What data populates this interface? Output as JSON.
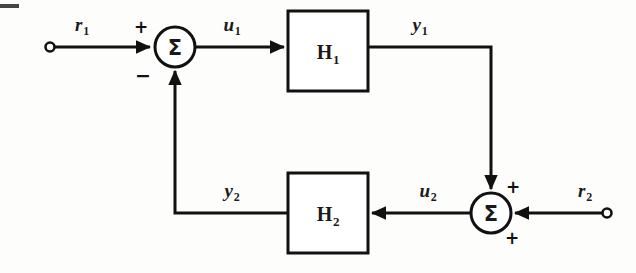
{
  "diagram": {
    "type": "control-block-diagram",
    "background_color": "#fdfdfb",
    "line_color": "#111111",
    "line_width": 3,
    "blocks": [
      {
        "id": "H1",
        "label": "H",
        "subscript": "1",
        "x": 288,
        "y": 11,
        "width": 80,
        "height": 80
      },
      {
        "id": "H2",
        "label": "H",
        "subscript": "2",
        "x": 288,
        "y": 173,
        "width": 80,
        "height": 80
      }
    ],
    "summers": [
      {
        "id": "sum1",
        "glyph": "Σ",
        "cx": 175,
        "cy": 47,
        "r": 20
      },
      {
        "id": "sum2",
        "glyph": "Σ",
        "cx": 491,
        "cy": 213,
        "r": 20
      }
    ],
    "terminals": [
      {
        "id": "r1-terminal",
        "cx": 50,
        "cy": 47,
        "r": 4.5
      },
      {
        "id": "r2-terminal",
        "cx": 607,
        "cy": 213,
        "r": 4.5
      }
    ],
    "signals": [
      {
        "id": "r1",
        "name": "r",
        "subscript": "1",
        "x": 82,
        "y": 24
      },
      {
        "id": "u1",
        "name": "u",
        "subscript": "1",
        "x": 232,
        "y": 24
      },
      {
        "id": "y1",
        "name": "y",
        "subscript": "1",
        "x": 420,
        "y": 24
      },
      {
        "id": "y2",
        "name": "y",
        "subscript": "2",
        "x": 232,
        "y": 190
      },
      {
        "id": "u2",
        "name": "u",
        "subscript": "2",
        "x": 428,
        "y": 190
      },
      {
        "id": "r2",
        "name": "r",
        "subscript": "2",
        "x": 585,
        "y": 190
      }
    ],
    "signs": [
      {
        "id": "sum1-plus",
        "symbol": "+",
        "x": 141,
        "y": 27,
        "summer": "sum1",
        "port": "left-input"
      },
      {
        "id": "sum1-minus",
        "symbol": "−",
        "x": 143,
        "y": 75,
        "summer": "sum1",
        "port": "bottom-input"
      },
      {
        "id": "sum2-plus-top",
        "symbol": "+",
        "x": 513,
        "y": 187,
        "summer": "sum2",
        "port": "top-input"
      },
      {
        "id": "sum2-plus-bottom",
        "symbol": "+",
        "x": 512,
        "y": 238,
        "summer": "sum2",
        "port": "right-input"
      }
    ],
    "connections": [
      {
        "id": "r1-to-sum1",
        "from": "r1-terminal",
        "to": "sum1",
        "arrow": true
      },
      {
        "id": "sum1-to-H1",
        "from": "sum1",
        "to": "H1",
        "label": "u1",
        "arrow": true
      },
      {
        "id": "H1-to-sum2",
        "from": "H1",
        "to": "sum2",
        "label": "y1",
        "arrow": true
      },
      {
        "id": "r2-to-sum2",
        "from": "r2-terminal",
        "to": "sum2",
        "arrow": true
      },
      {
        "id": "sum2-to-H2",
        "from": "sum2",
        "to": "H2",
        "label": "u2",
        "arrow": true
      },
      {
        "id": "H2-to-sum1",
        "from": "H2",
        "to": "sum1",
        "label": "y2",
        "arrow": true
      }
    ]
  }
}
